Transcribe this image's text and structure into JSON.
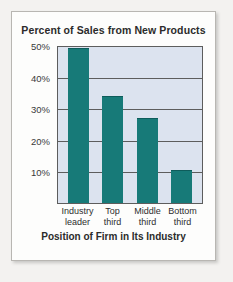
{
  "chart_data": {
    "type": "bar",
    "title": "Percent of Sales from New Products",
    "xlabel": "Position of Firm in Its Industry",
    "ylabel": "",
    "categories": [
      "Industry leader",
      "Top third",
      "Middle third",
      "Bottom third"
    ],
    "category_lines": [
      [
        "Industry",
        "leader"
      ],
      [
        "Top",
        "third"
      ],
      [
        "Middle",
        "third"
      ],
      [
        "Bottom",
        "third"
      ]
    ],
    "values": [
      49,
      34,
      27,
      10.5
    ],
    "ylim": [
      0,
      50
    ],
    "yticks": [
      10,
      20,
      30,
      40,
      50
    ],
    "ytick_labels": [
      "10%",
      "20%",
      "30%",
      "40%",
      "50%"
    ],
    "grid": true,
    "legend": false,
    "bar_color": "#177a78",
    "plot_background": "#dce3ef",
    "axis_color": "#5d5d5d"
  },
  "frame": {
    "page_background": "#f3f2f0",
    "card_background": "#fdfdfc",
    "card_border": "#b8b6b2"
  }
}
